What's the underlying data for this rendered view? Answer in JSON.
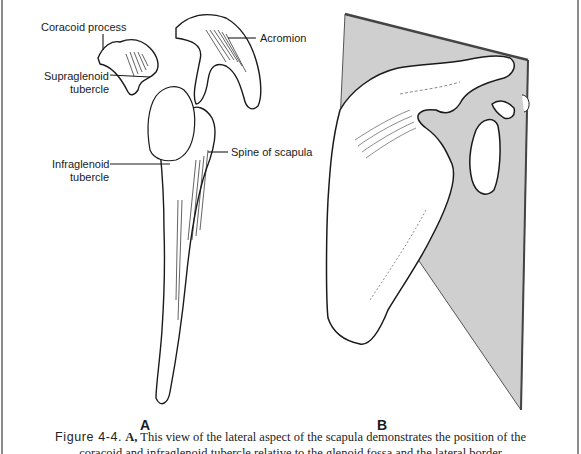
{
  "figure": {
    "panel_a": {
      "letter": "A",
      "labels": [
        {
          "id": "coracoid",
          "text": "Coracoid process"
        },
        {
          "id": "acromion",
          "text": "Acromion"
        },
        {
          "id": "supraglenoid_1",
          "text": "Supraglenoid"
        },
        {
          "id": "supraglenoid_2",
          "text": "tubercle"
        },
        {
          "id": "infraglenoid_1",
          "text": "Infraglenoid"
        },
        {
          "id": "infraglenoid_2",
          "text": "tubercle"
        },
        {
          "id": "spine",
          "text": "Spine of scapula"
        }
      ]
    },
    "panel_b": {
      "letter": "B"
    },
    "caption": {
      "figure_number": "Figure 4-4.",
      "panel_ref": "A,",
      "line1": "This view of the lateral aspect of the scapula demonstrates the position of the",
      "line2_clipped": "coracoid and infraglenoid tubercle relative to the glenoid fossa and the lateral border"
    }
  }
}
